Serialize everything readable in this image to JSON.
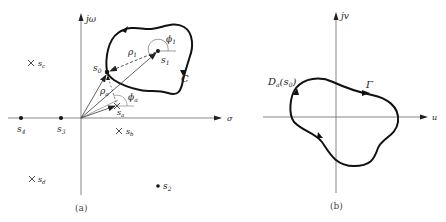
{
  "panel_a": {
    "caption": "(a)",
    "axes": {
      "horizontal": "σ",
      "vertical": "jω"
    },
    "contour_label": "C",
    "points": [
      {
        "name": "s0",
        "label": "s",
        "sub": "0",
        "type": "dot"
      },
      {
        "name": "s1",
        "label": "s",
        "sub": "1",
        "type": "dot"
      },
      {
        "name": "s2",
        "label": "s",
        "sub": "2",
        "type": "dot"
      },
      {
        "name": "s3",
        "label": "s",
        "sub": "3",
        "type": "dot"
      },
      {
        "name": "s4",
        "label": "s",
        "sub": "4",
        "type": "dot"
      },
      {
        "name": "sa",
        "label": "s",
        "sub": "a",
        "type": "cross"
      },
      {
        "name": "sb",
        "label": "s",
        "sub": "b",
        "type": "cross"
      },
      {
        "name": "sc",
        "label": "s",
        "sub": "c",
        "type": "cross"
      },
      {
        "name": "sd",
        "label": "s",
        "sub": "d",
        "type": "cross"
      }
    ],
    "vectors": {
      "rho1": "ρ",
      "rho1_sub": "1",
      "phi1": "ϕ",
      "phi1_sub": "1",
      "rhoa": "ρ",
      "rhoa_sub": "a",
      "phia": "ϕ",
      "phia_sub": "a"
    }
  },
  "panel_b": {
    "caption": "(b)",
    "axes": {
      "horizontal": "u",
      "vertical": "jv"
    },
    "contour_label": "Γ",
    "point_label": "D",
    "point_label_sub": "a",
    "point_label_arg": "(s",
    "point_label_arg_sub": "0",
    "point_label_close": ")"
  }
}
